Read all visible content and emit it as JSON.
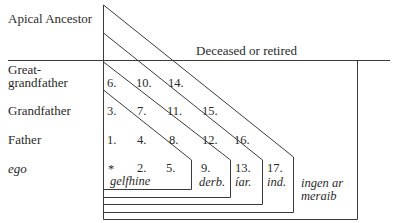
{
  "generations": {
    "apical": "Apical Ancestor",
    "great_1": "Great-",
    "great_2": "grandfather",
    "grandfather": "Grandfather",
    "father": "Father",
    "ego": "ego"
  },
  "deceased_label": "Deceased or retired",
  "cells": {
    "c6": "6.",
    "c10": "10.",
    "c14": "14.",
    "c3": "3.",
    "c7": "7.",
    "c11": "11.",
    "c15": "15.",
    "c1": "1.",
    "c4": "4.",
    "c8": "8.",
    "c12": "12.",
    "c16": "16.",
    "ego_mark": "*",
    "c2": "2.",
    "c5": "5.",
    "c9": "9.",
    "c13": "13.",
    "c17": "17."
  },
  "groups": {
    "gelfhine": "gelfhine",
    "derb": "derb.",
    "iar": "íar.",
    "ind": "ind.",
    "ingen_1": "ingen ar",
    "ingen_2": "meraib"
  },
  "colors": {
    "line": "#3a3a3a",
    "text": "#2a2a2a",
    "background": "#ffffff"
  }
}
